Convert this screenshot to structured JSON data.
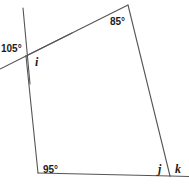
{
  "figure": {
    "type": "geometry-diagram",
    "stroke_color": "#555555",
    "background_color": "#ffffff",
    "text_color": "#1b1b1b",
    "width": 189,
    "height": 184
  },
  "labels": {
    "angle_top_left_exterior": "105°",
    "angle_apex": "85°",
    "angle_bottom_left": "95°",
    "unknown_i": "i",
    "unknown_j": "j",
    "unknown_k": "k"
  },
  "vertices": {
    "apex_top": [
      128,
      5
    ],
    "upper_left": [
      26,
      56
    ],
    "lower_left": [
      38,
      173
    ],
    "lower_right": [
      170,
      176
    ]
  },
  "segments": [
    {
      "name": "side-apex-to-upper-left",
      "from": [
        128,
        5
      ],
      "to": [
        26,
        56
      ]
    },
    {
      "name": "side-upper-left-to-lower-left",
      "from": [
        26,
        56
      ],
      "to": [
        38,
        173
      ]
    },
    {
      "name": "side-apex-to-lower-right",
      "from": [
        128,
        5
      ],
      "to": [
        170,
        176
      ]
    },
    {
      "name": "base-lower-left-to-lower-right",
      "from": [
        38,
        173
      ],
      "to": [
        170,
        176
      ]
    },
    {
      "name": "transversal-ray-upper",
      "from": [
        23,
        8
      ],
      "to": [
        26,
        56
      ]
    },
    {
      "name": "transversal-ray-lower-left",
      "from": [
        26,
        56
      ],
      "to": [
        0,
        69
      ]
    },
    {
      "name": "base-extension-right",
      "from": [
        170,
        176
      ],
      "to": [
        189,
        176
      ]
    }
  ]
}
